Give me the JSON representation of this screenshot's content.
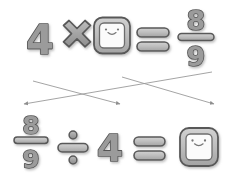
{
  "document": {
    "type": "math-worksheet",
    "background_color": "#ffffff",
    "glyph_fill": "#9b9b9b",
    "glyph_outline": "#555555",
    "arrow_color": "#8a8a8a"
  },
  "equations": [
    {
      "id": "top-equation",
      "terms": [
        {
          "kind": "number",
          "text": "4"
        },
        {
          "kind": "operator",
          "name": "multiply-icon",
          "text": "×"
        },
        {
          "kind": "answer-box",
          "name": "answer-box-face",
          "text": ""
        },
        {
          "kind": "operator",
          "name": "equals-icon",
          "text": "="
        },
        {
          "kind": "fraction",
          "numerator": "8",
          "denominator": "9"
        }
      ]
    },
    {
      "id": "bottom-equation",
      "terms": [
        {
          "kind": "fraction",
          "numerator": "8",
          "denominator": "9"
        },
        {
          "kind": "operator",
          "name": "divide-icon",
          "text": "÷"
        },
        {
          "kind": "number",
          "text": "4"
        },
        {
          "kind": "operator",
          "name": "equals-icon",
          "text": "="
        },
        {
          "kind": "answer-box",
          "name": "answer-box-face",
          "text": ""
        }
      ]
    }
  ],
  "arrows": [
    {
      "id": "arrow-left-to-right",
      "from": "under-4-top",
      "to": "toward-right",
      "direction": "down-right"
    },
    {
      "id": "arrow-right-to-left",
      "from": "under-fraction-top",
      "to": "toward-left",
      "direction": "down-left"
    }
  ],
  "top": {
    "four": "4",
    "times": "×",
    "equals": "=",
    "frac_num": "8",
    "frac_den": "9"
  },
  "bottom": {
    "frac_num": "8",
    "frac_den": "9",
    "divide": "÷",
    "four": "4",
    "equals": "="
  }
}
